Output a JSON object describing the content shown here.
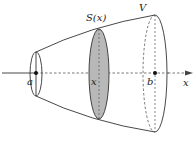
{
  "diagram": {
    "type": "solid-of-revolution-cross-section",
    "labels": {
      "section": "S(x)",
      "volume": "V",
      "lower_bound": "a",
      "variable": "x",
      "upper_bound": "b",
      "axis": "x"
    },
    "colors": {
      "stroke": "#333333",
      "section_fill": "#b8b8b8",
      "background": "#ffffff"
    }
  }
}
